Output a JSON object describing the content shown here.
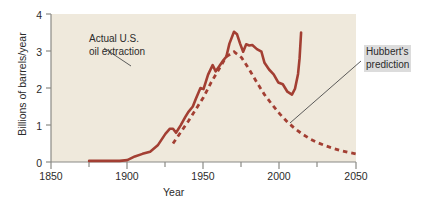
{
  "chart_data": {
    "type": "line",
    "title": "",
    "xlabel": "Year",
    "ylabel": "Billions of barrels/year",
    "xlim": [
      1850,
      2050
    ],
    "ylim": [
      0,
      4
    ],
    "xticks": [
      1850,
      1900,
      1950,
      2000,
      2050
    ],
    "xtick_labels": [
      "1850",
      "1900",
      "1950",
      "2000",
      "2050"
    ],
    "xminorticks": [
      1875,
      1925,
      1975,
      2025
    ],
    "yticks": [
      0,
      1,
      2,
      3,
      4
    ],
    "ytick_labels": [
      "0",
      "1",
      "2",
      "3",
      "4"
    ],
    "grid": false,
    "legend_position": "annotations",
    "plot_background": "#efe9dc",
    "series": [
      {
        "name": "Actual U.S. oil extraction",
        "style": "solid",
        "color": "#a33f33",
        "x": [
          1875,
          1880,
          1885,
          1890,
          1895,
          1900,
          1905,
          1910,
          1915,
          1920,
          1925,
          1928,
          1930,
          1932,
          1935,
          1938,
          1940,
          1943,
          1945,
          1948,
          1950,
          1953,
          1956,
          1958,
          1960,
          1963,
          1965,
          1967,
          1970,
          1972,
          1974,
          1976,
          1978,
          1980,
          1982,
          1985,
          1988,
          1990,
          1993,
          1996,
          1999,
          2002,
          2005,
          2008,
          2010,
          2012,
          2013,
          2014
        ],
        "y": [
          0.03,
          0.03,
          0.03,
          0.03,
          0.03,
          0.05,
          0.15,
          0.22,
          0.28,
          0.45,
          0.76,
          0.9,
          0.9,
          0.79,
          0.99,
          1.21,
          1.35,
          1.5,
          1.71,
          2.0,
          1.97,
          2.36,
          2.62,
          2.45,
          2.57,
          2.75,
          2.85,
          3.2,
          3.52,
          3.45,
          3.2,
          2.98,
          3.18,
          3.15,
          3.16,
          3.05,
          2.98,
          2.68,
          2.5,
          2.37,
          2.15,
          2.1,
          1.9,
          1.82,
          1.98,
          2.38,
          2.8,
          3.5
        ]
      },
      {
        "name": "Hubbert's prediction",
        "style": "dashed",
        "color": "#a33f33",
        "x": [
          1930,
          1940,
          1950,
          1955,
          1960,
          1965,
          1970,
          1975,
          1980,
          1985,
          1990,
          1995,
          2000,
          2005,
          2010,
          2015,
          2020,
          2025,
          2030,
          2035,
          2040,
          2045,
          2050
        ],
        "y": [
          0.5,
          1.1,
          1.75,
          2.15,
          2.5,
          2.85,
          2.98,
          2.82,
          2.5,
          2.15,
          1.82,
          1.55,
          1.3,
          1.08,
          0.9,
          0.75,
          0.62,
          0.52,
          0.44,
          0.37,
          0.31,
          0.26,
          0.22
        ]
      }
    ],
    "annotations": [
      {
        "id": "actual",
        "line1": "Actual U.S.",
        "line2": "oil extraction",
        "leader_from": [
          104,
          48
        ],
        "leader_to": [
          131,
          66
        ]
      },
      {
        "id": "hubbert",
        "line1": "Hubbert's",
        "line2": "prediction",
        "leader_from": [
          290,
          123
        ],
        "leader_to": [
          361,
          61
        ]
      }
    ]
  }
}
